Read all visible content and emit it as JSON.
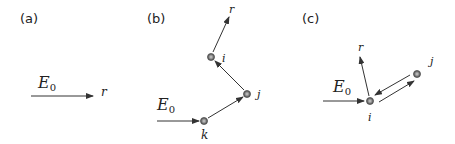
{
  "panels": [
    {
      "id": "a",
      "label": "(a)",
      "field_label": "E",
      "field_sub": "0",
      "scatter_label": "r"
    },
    {
      "id": "b",
      "label": "(b)",
      "field_label": "E",
      "field_sub": "0",
      "scatter_label": "r",
      "particles": [
        "i",
        "j",
        "k"
      ]
    },
    {
      "id": "c",
      "label": "(c)",
      "field_label": "E",
      "field_sub": "0",
      "scatter_label": "r",
      "particles": [
        "i",
        "j"
      ]
    }
  ],
  "colors": {
    "particle_fill": "#8a8a8a",
    "particle_ring": "#555555",
    "line": "#333333"
  }
}
